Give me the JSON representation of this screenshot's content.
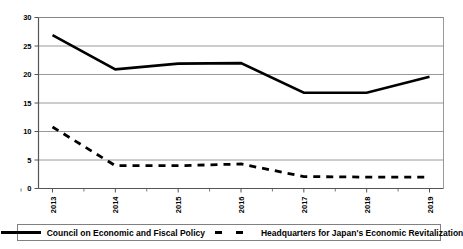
{
  "chart_data": {
    "type": "line",
    "title": "",
    "xlabel": "",
    "ylabel": "",
    "ylim": [
      0,
      30
    ],
    "ytick_values": [
      0,
      5,
      10,
      15,
      20,
      25,
      30
    ],
    "ytick_labels": [
      "0",
      "5",
      "10",
      "15",
      "20",
      "25",
      "30"
    ],
    "grid": true,
    "grid_axis": "y",
    "legend_position": "bottom",
    "categories": [
      "2013",
      "2014",
      "2015",
      "2016",
      "2017",
      "2018",
      "2019"
    ],
    "x_tick_labels": [
      "2013",
      "2014",
      "2015",
      "2016",
      "2017",
      "2018",
      "2019"
    ],
    "x_tick_label_rotation": 90,
    "series": [
      {
        "name": "Council on Economic and Fiscal Policy",
        "style": "solid",
        "color": "#000000",
        "values": [
          26.9,
          20.9,
          21.9,
          22.0,
          16.8,
          16.8,
          19.6
        ]
      },
      {
        "name": "Headquarters for Japan's Economic Revitalization",
        "style": "dashed",
        "color": "#000000",
        "values": [
          10.8,
          4.0,
          4.0,
          4.3,
          2.1,
          2.0,
          2.0
        ]
      }
    ]
  },
  "legend": {
    "entries": [
      {
        "label": "Council on Economic and Fiscal Policy",
        "swatch": "solid-line-swatch"
      },
      {
        "label": "Headquarters for Japan's Economic Revitalization",
        "swatch": "dashed-line-swatch"
      }
    ]
  },
  "colors": {
    "series_line": "#000000",
    "gridline": "#808080",
    "axis": "#555555",
    "background": "#ffffff"
  }
}
